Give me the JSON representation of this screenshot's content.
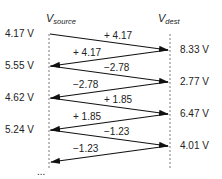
{
  "headers": {
    "source_main": "V",
    "source_sub": "source",
    "dest_main": "V",
    "dest_sub": "dest"
  },
  "source_voltages": [
    "4.17 V",
    "5.55 V",
    "4.62 V",
    "5.24 V"
  ],
  "dest_voltages": [
    "8.33 V",
    "2.77 V",
    "6.47 V",
    "4.01 V"
  ],
  "forward_labels": [
    "+ 4.17",
    "−2.78",
    "+ 1.85",
    "−1.23"
  ],
  "backward_labels": [
    "+ 4.17",
    "−2.78",
    "+ 1.85",
    "−1.23"
  ],
  "continuation": "..."
}
